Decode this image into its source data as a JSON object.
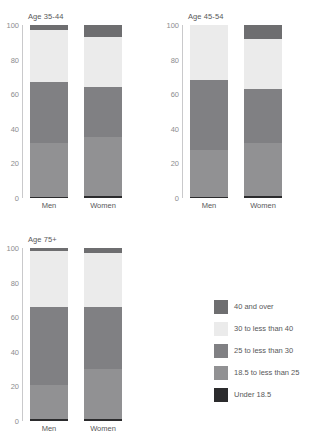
{
  "chart_data": {
    "type": "bar",
    "title": "",
    "xlabel": "",
    "ylabel": "",
    "ylim": [
      0,
      100
    ],
    "yticks": [
      "0",
      "20",
      "40",
      "60",
      "80",
      "100"
    ],
    "grid": false,
    "stacked": true,
    "legend_position": "bottom-right",
    "categories": [
      "Men",
      "Women"
    ],
    "legend": [
      {
        "label": "40 and over",
        "color": "#6e6e70"
      },
      {
        "label": "30 to less than 40",
        "color": "#ebebeb"
      },
      {
        "label": "25 to less than 30",
        "color": "#808083"
      },
      {
        "label": "18.5 to less than 25",
        "color": "#919193"
      },
      {
        "label": "Under 18.5",
        "color": "#2b2b2d"
      }
    ],
    "panels": [
      {
        "title": "Age 35-44",
        "bars": [
          {
            "category": "Men",
            "segments": [
              {
                "name": "Under 18.5",
                "value": 0.4,
                "color": "#2b2b2d"
              },
              {
                "name": "18.5 to less than 25",
                "value": 31.6,
                "color": "#919193"
              },
              {
                "name": "25 to less than 30",
                "value": 35.0,
                "color": "#808083"
              },
              {
                "name": "30 to less than 40",
                "value": 30.0,
                "color": "#ebebeb"
              },
              {
                "name": "40 and over",
                "value": 3.0,
                "color": "#6e6e70"
              }
            ]
          },
          {
            "category": "Women",
            "segments": [
              {
                "name": "Under 18.5",
                "value": 1.0,
                "color": "#2b2b2d"
              },
              {
                "name": "18.5 to less than 25",
                "value": 34.0,
                "color": "#919193"
              },
              {
                "name": "25 to less than 30",
                "value": 29.0,
                "color": "#808083"
              },
              {
                "name": "30 to less than 40",
                "value": 29.0,
                "color": "#ebebeb"
              },
              {
                "name": "40 and over",
                "value": 7.0,
                "color": "#6e6e70"
              }
            ]
          }
        ]
      },
      {
        "title": "Age 45-54",
        "bars": [
          {
            "category": "Men",
            "segments": [
              {
                "name": "Under 18.5",
                "value": 0.3,
                "color": "#2b2b2d"
              },
              {
                "name": "18.5 to less than 25",
                "value": 27.7,
                "color": "#919193"
              },
              {
                "name": "25 to less than 30",
                "value": 40.0,
                "color": "#808083"
              },
              {
                "name": "30 to less than 40",
                "value": 32.0,
                "color": "#ebebeb"
              },
              {
                "name": "40 and over",
                "value": 0.0,
                "color": "#6e6e70"
              }
            ]
          },
          {
            "category": "Women",
            "segments": [
              {
                "name": "Under 18.5",
                "value": 1.0,
                "color": "#2b2b2d"
              },
              {
                "name": "18.5 to less than 25",
                "value": 31.0,
                "color": "#919193"
              },
              {
                "name": "25 to less than 30",
                "value": 31.0,
                "color": "#808083"
              },
              {
                "name": "30 to less than 40",
                "value": 29.0,
                "color": "#ebebeb"
              },
              {
                "name": "40 and over",
                "value": 8.0,
                "color": "#6e6e70"
              }
            ]
          }
        ]
      },
      {
        "title": "Age 75+",
        "bars": [
          {
            "category": "Men",
            "segments": [
              {
                "name": "Under 18.5",
                "value": 1.0,
                "color": "#2b2b2d"
              },
              {
                "name": "18.5 to less than 25",
                "value": 20.0,
                "color": "#919193"
              },
              {
                "name": "25 to less than 30",
                "value": 45.0,
                "color": "#808083"
              },
              {
                "name": "30 to less than 40",
                "value": 32.5,
                "color": "#ebebeb"
              },
              {
                "name": "40 and over",
                "value": 1.5,
                "color": "#6e6e70"
              }
            ]
          },
          {
            "category": "Women",
            "segments": [
              {
                "name": "Under 18.5",
                "value": 1.0,
                "color": "#2b2b2d"
              },
              {
                "name": "18.5 to less than 25",
                "value": 29.0,
                "color": "#919193"
              },
              {
                "name": "25 to less than 30",
                "value": 36.0,
                "color": "#808083"
              },
              {
                "name": "30 to less than 40",
                "value": 31.0,
                "color": "#ebebeb"
              },
              {
                "name": "40 and over",
                "value": 3.0,
                "color": "#6e6e70"
              }
            ]
          }
        ]
      }
    ]
  }
}
